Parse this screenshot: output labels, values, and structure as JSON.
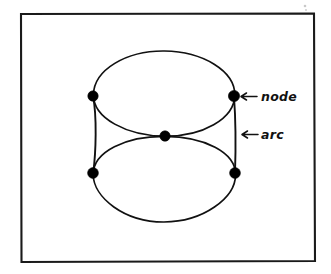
{
  "figure": {
    "background_color": "#ffffff",
    "ink_color": "#111111",
    "frame": {
      "x": 20,
      "y": 13,
      "width": 295,
      "height": 249,
      "stroke_color": "#1a1a1a"
    },
    "nodes": [
      {
        "id": "node-top-left",
        "label": "",
        "cx": 93,
        "cy": 96,
        "r": 5.2
      },
      {
        "id": "node-top-right",
        "label": "",
        "cx": 234,
        "cy": 96,
        "r": 5.6
      },
      {
        "id": "node-center",
        "label": "",
        "cx": 165,
        "cy": 136,
        "r": 5.2
      },
      {
        "id": "node-bottom-left",
        "label": "",
        "cx": 93,
        "cy": 173,
        "r": 5.4
      },
      {
        "id": "node-bottom-right",
        "label": "",
        "cx": 235,
        "cy": 173,
        "r": 5.4
      }
    ],
    "ellipses": [
      {
        "id": "upper-ellipse",
        "cx": 164,
        "cy": 93,
        "rx": 71,
        "ry": 43
      },
      {
        "id": "lower-ellipse",
        "cx": 164,
        "cy": 181,
        "rx": 71,
        "ry": 41
      }
    ],
    "vertical_arcs": [
      {
        "id": "left-arc",
        "from": "node-top-left",
        "to": "node-bottom-left"
      },
      {
        "id": "right-arc",
        "from": "node-top-right",
        "to": "node-bottom-right"
      }
    ],
    "annotations": [
      {
        "id": "node-annotation",
        "arrow": "←",
        "text": "node",
        "arrow_x": 243,
        "arrow_y": 97,
        "text_x": 261,
        "text_y": 101
      },
      {
        "id": "arc-annotation",
        "arrow": "←",
        "text": "arc",
        "arrow_x": 243,
        "arrow_y": 135,
        "text_x": 261,
        "text_y": 139
      }
    ]
  }
}
